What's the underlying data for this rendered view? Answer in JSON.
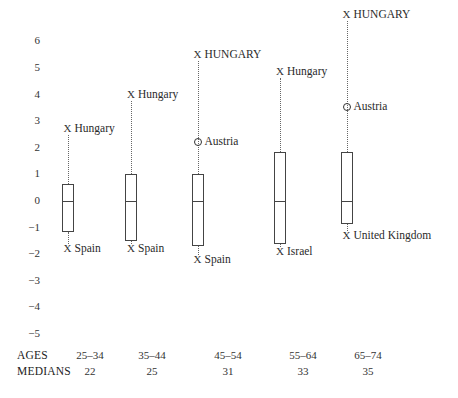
{
  "chart_data": {
    "type": "boxplot",
    "title": "",
    "xlabel": "",
    "ylabel": "",
    "ylim": [
      -5,
      6
    ],
    "yticks": [
      "6",
      "5",
      "4",
      "3",
      "2",
      "1",
      "0",
      "−1",
      "−2",
      "−3",
      "−4",
      "−5"
    ],
    "ytick_values": [
      6,
      5,
      4,
      3,
      2,
      1,
      0,
      -1,
      -2,
      -3,
      -4,
      -5
    ],
    "grid": false,
    "row_labels": {
      "ages": "AGES",
      "medians": "MEDIANS"
    },
    "groups": [
      {
        "age": "25–34",
        "median_label": "22",
        "q1": -1.15,
        "median": 0,
        "q3": 0.65,
        "upper": {
          "value": 2.7,
          "marker": "X",
          "label": "Hungary"
        },
        "lower": {
          "value": -1.8,
          "marker": "X",
          "label": "Spain"
        },
        "outliers": []
      },
      {
        "age": "35–44",
        "median_label": "25",
        "q1": -1.5,
        "median": 0,
        "q3": 1.0,
        "upper": {
          "value": 4.0,
          "marker": "X",
          "label": "Hungary"
        },
        "lower": {
          "value": -1.8,
          "marker": "X",
          "label": "Spain"
        },
        "outliers": []
      },
      {
        "age": "45–54",
        "median_label": "31",
        "q1": -1.7,
        "median": 0,
        "q3": 1.0,
        "upper": {
          "value": 5.5,
          "marker": "X",
          "label": "HUNGARY"
        },
        "lower": {
          "value": -2.2,
          "marker": "X",
          "label": "Spain"
        },
        "outliers": [
          {
            "value": 2.2,
            "marker": "O",
            "label": "Austria"
          }
        ]
      },
      {
        "age": "55–64",
        "median_label": "33",
        "q1": -1.6,
        "median": 0,
        "q3": 1.85,
        "upper": {
          "value": 4.85,
          "marker": "X",
          "label": "Hungary"
        },
        "lower": {
          "value": -1.9,
          "marker": "X",
          "label": "Israel"
        },
        "outliers": []
      },
      {
        "age": "65–74",
        "median_label": "35",
        "q1": -0.85,
        "median": 0,
        "q3": 1.85,
        "upper": {
          "value": 7.0,
          "marker": "X",
          "label": "HUNGARY"
        },
        "lower": {
          "value": -1.3,
          "marker": "X",
          "label": "United Kingdom"
        },
        "outliers": [
          {
            "value": 3.55,
            "marker": "O",
            "label": "Austria"
          }
        ]
      }
    ]
  },
  "footer": {
    "ages_label": "AGES",
    "medians_label": "MEDIANS",
    "ages": [
      "25–34",
      "35–44",
      "45–54",
      "55–64",
      "65–74"
    ],
    "medians": [
      "22",
      "25",
      "31",
      "33",
      "35"
    ]
  }
}
